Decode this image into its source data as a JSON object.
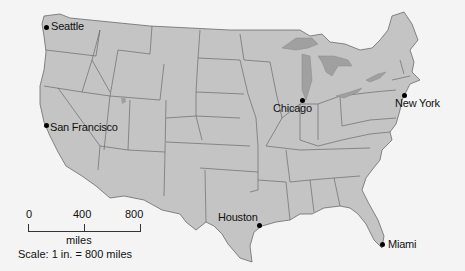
{
  "map": {
    "title": "United States",
    "colors": {
      "land": "#c4c4c4",
      "border": "#6a6a6a",
      "water": "#a0a0a0",
      "background": "#f4f4f4"
    },
    "cities": [
      {
        "name": "Seattle",
        "dot_x": 48,
        "dot_y": 27,
        "label_x": 51,
        "label_y": 20
      },
      {
        "name": "San Francisco",
        "dot_x": 47,
        "dot_y": 125,
        "label_x": 50,
        "label_y": 122
      },
      {
        "name": "Chicago",
        "dot_x": 302,
        "dot_y": 100,
        "label_x": 273,
        "label_y": 102
      },
      {
        "name": "New York",
        "dot_x": 404,
        "dot_y": 95,
        "label_x": 395,
        "label_y": 97
      },
      {
        "name": "Houston",
        "dot_x": 259,
        "dot_y": 225,
        "label_x": 218,
        "label_y": 212
      },
      {
        "name": "Miami",
        "dot_x": 382,
        "dot_y": 244,
        "label_x": 388,
        "label_y": 239
      }
    ]
  },
  "scale": {
    "ticks": [
      "0",
      "400",
      "800"
    ],
    "units": "miles",
    "ratio_text": "Scale: 1 in. = 800 miles"
  }
}
